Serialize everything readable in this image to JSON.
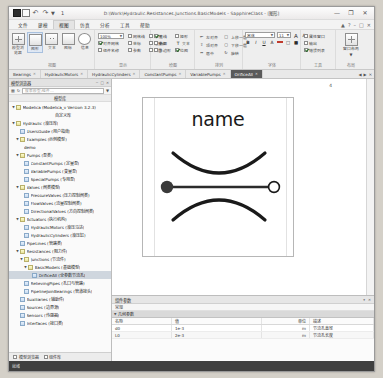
{
  "window": {
    "title": "D:\\Work\\Hydraulic.Resistances.Junctions.BasicModels - SapphireClass - [图形]",
    "quick_access": {
      "app_icon": "app-icon",
      "save": "save-icon",
      "undo": "undo-icon",
      "redo": "redo-icon",
      "more": "chevron-down-icon",
      "badge_num": "1"
    },
    "buttons": {
      "minimize": "—",
      "maximize": "❐",
      "close": "✕"
    }
  },
  "ribbon": {
    "tabs": [
      {
        "label": "文件",
        "active": false
      },
      {
        "label": "建模",
        "active": false
      },
      {
        "label": "视图",
        "active": true
      },
      {
        "label": "仿真",
        "active": false
      },
      {
        "label": "分析",
        "active": false
      },
      {
        "label": "工具",
        "active": false
      },
      {
        "label": "帮助",
        "active": false
      }
    ],
    "tab_badge": "3",
    "right_controls": [
      "最小化功能区",
      "帮助",
      "最小化",
      "还原",
      "关闭"
    ],
    "groups": [
      {
        "title": "视图",
        "badge": "2",
        "big_buttons": [
          {
            "label": "模型浏览器",
            "icon": "browser-icon",
            "selected": false
          },
          {
            "label": "图形",
            "icon": "diagram-icon",
            "selected": true
          },
          {
            "label": "文本",
            "icon": "text-icon",
            "selected": false
          },
          {
            "label": "图标",
            "icon": "icon-view-icon",
            "selected": false
          },
          {
            "label": "文档",
            "icon": "document-icon",
            "selected": false
          },
          {
            "label": "信息",
            "icon": "info-icon",
            "selected": false
          }
        ]
      },
      {
        "title": "显示",
        "combo": {
          "value": "100%",
          "placeholder": "缩放"
        },
        "checks": [
          {
            "label": "网格线",
            "on": false
          },
          {
            "label": "标尺",
            "on": false
          },
          {
            "label": "对齐网格",
            "on": true
          },
          {
            "label": "坐标",
            "on": false
          },
          {
            "label": "连接点",
            "on": false
          },
          {
            "label": "图层",
            "on": false
          },
          {
            "label": "组件名称",
            "on": false
          },
          {
            "label": "参数",
            "on": false
          },
          {
            "label": "标注",
            "on": false
          }
        ]
      },
      {
        "title": "绘图",
        "checks": [
          {
            "label": "直线",
            "on": true
          },
          {
            "label": "矩形",
            "on": false
          },
          {
            "label": "椭圆",
            "on": false
          },
          {
            "label": "文本",
            "on": false
          },
          {
            "label": "多边形",
            "on": false
          },
          {
            "label": "位图",
            "on": false
          }
        ]
      },
      {
        "title": "排列",
        "items": [
          "左对齐",
          "顶对齐",
          "居中",
          "水平分布",
          "垂直分布",
          "上移一层",
          "下移一层",
          "旋转",
          "翻转"
        ]
      },
      {
        "title": "字体",
        "font_combo": {
          "value": "宋体"
        },
        "size_combo": {
          "value": "11"
        },
        "grow": "A",
        "shrink": "A",
        "buttons": [
          "B",
          "I",
          "U",
          "A",
          "边框",
          "填充"
        ]
      },
      {
        "title": "工具",
        "checks": [
          {
            "label": "属性窗口",
            "on": false
          },
          {
            "label": "输出",
            "on": false
          },
          {
            "label": "错误列表",
            "on": true
          }
        ]
      },
      {
        "title": "布局",
        "big_buttons": [
          {
            "label": "窗口布局",
            "icon": "layout-icon",
            "selected": false
          }
        ]
      }
    ]
  },
  "library_tabs": {
    "tabs": [
      {
        "label": "Bearings",
        "active": false
      },
      {
        "label": "HydraulicMotors",
        "active": false
      },
      {
        "label": "HydraulicCylinders",
        "active": false
      },
      {
        "label": "ConstantPumps",
        "active": false
      },
      {
        "label": "VariablePumps",
        "active": false
      },
      {
        "label": "OrificeAll",
        "active": true
      }
    ],
    "nav": [
      "◀",
      "▶",
      "✕"
    ]
  },
  "left_panel": {
    "title": "模型浏览器",
    "title_controls": [
      "−",
      "□",
      "✕"
    ],
    "toolbar": {
      "tree_icon": "tree-icon",
      "refresh_icon": "refresh-icon",
      "search_placeholder": "搜索模型/组件...",
      "filter_icon": "filter-icon"
    },
    "section_header": "模型库",
    "tree": [
      {
        "depth": 0,
        "twist": "▼",
        "icon": "pkg",
        "label": "Modelica (Modelica_v Version 3.2.3)"
      },
      {
        "depth": 0,
        "twist": "",
        "icon": "none",
        "label": "自定义库",
        "is_section": true
      },
      {
        "depth": 0,
        "twist": "▼",
        "icon": "pkg",
        "label": "Hydraulic (液压库)"
      },
      {
        "depth": 1,
        "twist": "",
        "icon": "mdl",
        "label": "UsersGuide (用户指南)"
      },
      {
        "depth": 1,
        "twist": "▼",
        "icon": "pkg",
        "label": "Examples (示例模型)"
      },
      {
        "depth": 2,
        "twist": "",
        "icon": "none",
        "label": "demo"
      },
      {
        "depth": 1,
        "twist": "▼",
        "icon": "pkg",
        "label": "Pumps (泵类)"
      },
      {
        "depth": 2,
        "twist": "",
        "icon": "mdl",
        "label": "ConstantPumps (定量泵)"
      },
      {
        "depth": 2,
        "twist": "",
        "icon": "mdl",
        "label": "VariablePumps (变量泵)"
      },
      {
        "depth": 2,
        "twist": "",
        "icon": "mdl",
        "label": "SpecialPumps (专用泵)"
      },
      {
        "depth": 1,
        "twist": "▼",
        "icon": "pkg",
        "label": "Valves (阀类模型)"
      },
      {
        "depth": 2,
        "twist": "",
        "icon": "mdl",
        "label": "PressureValves (压力控制阀类)"
      },
      {
        "depth": 2,
        "twist": "",
        "icon": "mdl",
        "label": "FlowValves (流量控制阀类)"
      },
      {
        "depth": 2,
        "twist": "",
        "icon": "mdl",
        "label": "DirectionalValves (方向控制阀类)"
      },
      {
        "depth": 1,
        "twist": "▼",
        "icon": "pkg",
        "label": "Actuators (执行机构)"
      },
      {
        "depth": 2,
        "twist": "",
        "icon": "mdl",
        "label": "HydraulicMotors (液压马达)"
      },
      {
        "depth": 2,
        "twist": "",
        "icon": "mdl",
        "label": "HydraulicCylinders (液压缸)"
      },
      {
        "depth": 1,
        "twist": "",
        "icon": "mdl",
        "label": "PipeLines (管路类)"
      },
      {
        "depth": 1,
        "twist": "▼",
        "icon": "pkg",
        "label": "Resistances (阻力件)"
      },
      {
        "depth": 2,
        "twist": "▼",
        "icon": "pkg",
        "label": "Junctions (节流件)"
      },
      {
        "depth": 3,
        "twist": "▼",
        "icon": "pkg",
        "label": "BasicModels (基础模型)"
      },
      {
        "depth": 4,
        "twist": "",
        "icon": "mdl",
        "label": "OrificeAll (全参数节流孔)",
        "selected": true
      },
      {
        "depth": 2,
        "twist": "",
        "icon": "mdl",
        "label": "RelievingPipes (孔口与管路)"
      },
      {
        "depth": 2,
        "twist": "",
        "icon": "mdl",
        "label": "PipelineJoinBearings (管道接头)"
      },
      {
        "depth": 1,
        "twist": "",
        "icon": "mdl",
        "label": "Auxiliaries (辅助件)"
      },
      {
        "depth": 1,
        "twist": "",
        "icon": "mdl",
        "label": "Sources (边界源)"
      },
      {
        "depth": 1,
        "twist": "",
        "icon": "mdl",
        "label": "Sensors (传感器)"
      },
      {
        "depth": 1,
        "twist": "",
        "icon": "mdl",
        "label": "Interfaces (接口类)"
      }
    ],
    "bottom_tabs": [
      {
        "label": "模型浏览器",
        "active": true
      },
      {
        "label": "组件库",
        "active": false
      }
    ]
  },
  "canvas": {
    "corner_number": "4",
    "component": {
      "name_text": "name",
      "icon_name": "orifice-symbol",
      "left_port": "filled-port",
      "right_port": "open-port"
    }
  },
  "properties": {
    "header": "组件参数",
    "header_controls": [
      "▾",
      "✕"
    ],
    "subheader": "常规",
    "group_row": "几何参数",
    "columns": [
      "名称",
      "值",
      "单位",
      "描述"
    ],
    "rows": [
      {
        "name": "d0",
        "value": "1e-3",
        "unit": "m",
        "desc": "节流孔直径"
      },
      {
        "name": "L0",
        "value": "2e-3",
        "unit": "m",
        "desc": "节流孔长度"
      }
    ]
  },
  "statusbar": {
    "left": "就绪",
    "right": []
  },
  "colors": {
    "accent": "#5a5a5a",
    "selection": "#cfd6de",
    "ribbon_selected": "#dfe8f4",
    "status_bg": "#3f3f3f",
    "canvas_bg": "#ffffff"
  }
}
